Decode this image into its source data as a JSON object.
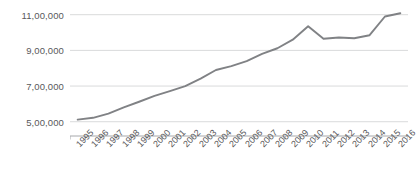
{
  "chart_data": {
    "type": "line",
    "title": "",
    "xlabel": "",
    "ylabel": "",
    "categories": [
      "1995",
      "1996",
      "1997",
      "1998",
      "1999",
      "2000",
      "2001",
      "2002",
      "2003",
      "2004",
      "2005",
      "2006",
      "2007",
      "2008",
      "2009",
      "2010",
      "2011",
      "2012",
      "2013",
      "2014",
      "2015",
      "2016"
    ],
    "values": [
      512000,
      522000,
      545000,
      580000,
      612000,
      645000,
      672000,
      700000,
      742000,
      790000,
      812000,
      840000,
      880000,
      912000,
      960000,
      1035000,
      965000,
      972000,
      968000,
      985000,
      1090000,
      1108000
    ],
    "series": [
      {
        "name": "series-1",
        "values": [
          512000,
          522000,
          545000,
          580000,
          612000,
          645000,
          672000,
          700000,
          742000,
          790000,
          812000,
          840000,
          880000,
          912000,
          960000,
          1035000,
          965000,
          972000,
          968000,
          985000,
          1090000,
          1108000
        ]
      }
    ],
    "yticks": [
      500000,
      700000,
      900000,
      1100000
    ],
    "ytick_labels": [
      "5,00,000",
      "7,00,000",
      "9,00,000",
      "11,00,000"
    ],
    "ylim": [
      420000,
      1160000
    ],
    "grid": true,
    "legend": false,
    "legend_position": "none",
    "line_color": "#808285",
    "axis_color": "#a6a8ab",
    "grid_color": "#d9dadb",
    "tick_label_color": "#59595b"
  }
}
